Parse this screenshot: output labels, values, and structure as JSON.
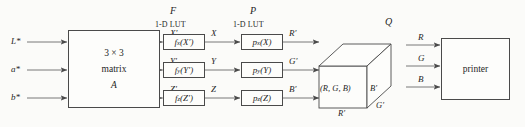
{
  "diagram": {
    "background_color": "#fbfbf9",
    "line_color": "#4a4a4a"
  },
  "inputs": [
    {
      "label": "L*",
      "y": 42
    },
    {
      "label": "a*",
      "y": 70
    },
    {
      "label": "b*",
      "y": 98
    }
  ],
  "matrix_block": {
    "line1": "3 × 3",
    "line2": "matrix",
    "line3": "A"
  },
  "intermediate_primed": [
    {
      "label": "X′"
    },
    {
      "label": "Y′"
    },
    {
      "label": "Z′"
    }
  ],
  "stage_f": {
    "group_label": "F",
    "caption": "1-D LUT",
    "boxes": [
      {
        "fn": "f",
        "sub": "x",
        "arg": "(X′)"
      },
      {
        "fn": "f",
        "sub": "y",
        "arg": "(Y′)"
      },
      {
        "fn": "f",
        "sub": "z",
        "arg": "(Z′)"
      }
    ]
  },
  "intermediate_xyz": [
    {
      "label": "X"
    },
    {
      "label": "Y"
    },
    {
      "label": "Z"
    }
  ],
  "stage_p": {
    "group_label": "P",
    "caption": "1-D LUT",
    "boxes": [
      {
        "fn": "p",
        "sub": "x",
        "arg": "(X)"
      },
      {
        "fn": "p",
        "sub": "y",
        "arg": "(Y)"
      },
      {
        "fn": "p",
        "sub": "z",
        "arg": "(Z)"
      }
    ]
  },
  "intermediate_rgb_primed": [
    {
      "label": "R′"
    },
    {
      "label": "G′"
    },
    {
      "label": "B′"
    }
  ],
  "stage_q": {
    "group_label": "Q",
    "face_label": "(R, G, B)",
    "edge_right": "B′",
    "edge_bottom": "R′",
    "edge_depth": "G′"
  },
  "printer_inputs": [
    {
      "label": "R"
    },
    {
      "label": "G"
    },
    {
      "label": "B"
    }
  ],
  "printer_block": {
    "label": "printer"
  }
}
